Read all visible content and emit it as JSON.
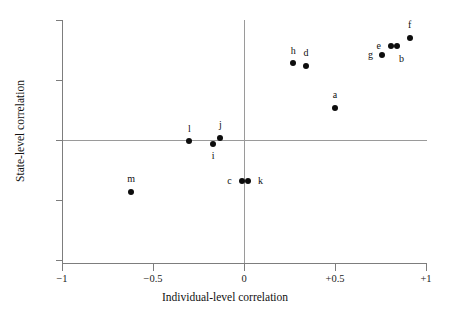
{
  "chart_data": {
    "type": "scatter",
    "title": "",
    "xlabel": "Individual-level correlation",
    "ylabel": "State-level correlation",
    "xlim": [
      -1,
      1
    ],
    "ylim": [
      -1,
      1
    ],
    "xticks": [
      -1,
      -0.5,
      0,
      0.5,
      1
    ],
    "xticklabels": [
      "−1",
      "−0.5",
      "0",
      "+0.5",
      "+1"
    ],
    "yticks": [
      -1,
      -0.5,
      0,
      0.5,
      1
    ],
    "yticklabels": [
      "−1",
      "−0.5",
      "0",
      "+0.5",
      "+1"
    ],
    "grid": false,
    "legend": "none",
    "reference_lines": [
      {
        "orientation": "vertical",
        "value": 0
      },
      {
        "orientation": "horizontal",
        "value": 0
      }
    ],
    "points": [
      {
        "label": "a",
        "x": 0.5,
        "y": 0.27,
        "label_dx": 0,
        "label_dy": 0.105
      },
      {
        "label": "b",
        "x": 0.84,
        "y": 0.78,
        "label_dx": 0.025,
        "label_dy": -0.105
      },
      {
        "label": "c",
        "x": -0.01,
        "y": -0.34,
        "label_dx": -0.07,
        "label_dy": 0.0
      },
      {
        "label": "d",
        "x": 0.34,
        "y": 0.62,
        "label_dx": 0,
        "label_dy": 0.105
      },
      {
        "label": "e",
        "x": 0.81,
        "y": 0.78,
        "label_dx": -0.07,
        "label_dy": 0.0
      },
      {
        "label": "f",
        "x": 0.91,
        "y": 0.85,
        "label_dx": 0,
        "label_dy": 0.105
      },
      {
        "label": "g",
        "x": 0.76,
        "y": 0.71,
        "label_dx": -0.065,
        "label_dy": 0.0
      },
      {
        "label": "h",
        "x": 0.27,
        "y": 0.64,
        "label_dx": 0,
        "label_dy": 0.105
      },
      {
        "label": "i",
        "x": -0.17,
        "y": -0.03,
        "label_dx": 0,
        "label_dy": -0.105
      },
      {
        "label": "j",
        "x": -0.13,
        "y": 0.02,
        "label_dx": 0,
        "label_dy": 0.105
      },
      {
        "label": "k",
        "x": 0.02,
        "y": -0.34,
        "label_dx": 0.07,
        "label_dy": 0.0
      },
      {
        "label": "l",
        "x": -0.3,
        "y": -0.01,
        "label_dx": 0,
        "label_dy": 0.105
      },
      {
        "label": "m",
        "x": -0.62,
        "y": -0.43,
        "label_dx": 0,
        "label_dy": 0.105
      }
    ]
  }
}
